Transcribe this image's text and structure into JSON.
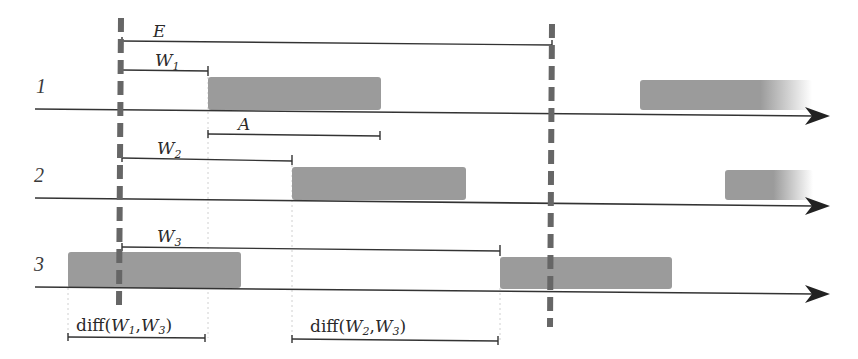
{
  "diagram": {
    "type": "timeline-schedule",
    "colors": {
      "axis": "#333333",
      "block": "#9b9b9b",
      "dashed_marker": "#666666",
      "guide": "#cfcfcf",
      "text": "#2a2a2a"
    },
    "rows": [
      {
        "label": "1",
        "axis_y": 110
      },
      {
        "label": "2",
        "axis_y": 200
      },
      {
        "label": "3",
        "axis_y": 288
      }
    ],
    "markers": {
      "left_x": 121,
      "right_x": 552
    },
    "intervals": {
      "E": {
        "label": "E"
      },
      "W1": {
        "base": "W",
        "sub": "1"
      },
      "A": {
        "label": "A"
      },
      "W2": {
        "base": "W",
        "sub": "2"
      },
      "W3": {
        "base": "W",
        "sub": "3"
      }
    },
    "diffs": [
      {
        "prefix": "diff(",
        "a_base": "W",
        "a_sub": "1",
        "sep": ",",
        "b_base": "W",
        "b_sub": "3",
        "suffix": ")"
      },
      {
        "prefix": "diff(",
        "a_base": "W",
        "a_sub": "2",
        "sep": ",",
        "b_base": "W",
        "b_sub": "3",
        "suffix": ")"
      }
    ]
  }
}
